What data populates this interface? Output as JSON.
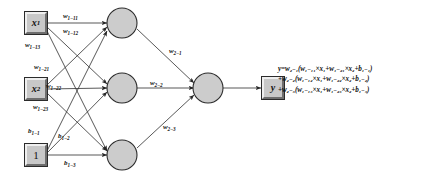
{
  "diagram": {
    "colors": {
      "node_fill": "#cccccc",
      "node_stroke": "#2b2b2b",
      "box_fill": "#c8c8c8",
      "edge": "#3a3a3a",
      "background": "#ffffff",
      "text": "#101010"
    },
    "inputs": [
      {
        "id": "x1",
        "base": "x",
        "sub": "1",
        "styled": "italic"
      },
      {
        "id": "x2",
        "base": "x",
        "sub": "2",
        "styled": "italic"
      },
      {
        "id": "bias",
        "base": "1",
        "sub": "",
        "styled": "plain"
      }
    ],
    "hidden_nodes": [
      {
        "id": "h1",
        "label": ""
      },
      {
        "id": "h2",
        "label": ""
      },
      {
        "id": "h3",
        "label": ""
      }
    ],
    "output_node": {
      "id": "o1",
      "label": ""
    },
    "output_box": {
      "id": "y",
      "base": "y",
      "sub": "",
      "styled": "italic"
    },
    "edge_labels": {
      "w1_11": {
        "base": "w",
        "sub": "1−11"
      },
      "w1_12": {
        "base": "w",
        "sub": "1−12"
      },
      "w1_13": {
        "base": "w",
        "sub": "1−13"
      },
      "w1_21": {
        "base": "w",
        "sub": "1−21"
      },
      "w1_22": {
        "base": "w",
        "sub": "1−22"
      },
      "w1_23": {
        "base": "w",
        "sub": "1−23"
      },
      "b1_1": {
        "base": "b",
        "sub": "1−1"
      },
      "b1_2": {
        "base": "b",
        "sub": "1−2"
      },
      "b1_3": {
        "base": "b",
        "sub": "1−3"
      },
      "w2_1": {
        "base": "w",
        "sub": "2−1"
      },
      "w2_2": {
        "base": "w",
        "sub": "2−2"
      },
      "w2_3": {
        "base": "w",
        "sub": "2−3"
      }
    },
    "equation": {
      "line1": "y=w₂₋₁(w₁₋₁₁×x₁+w₁₋₂₁×x₂+b₁₋₁)",
      "line2": "+w₂₋₂(w₁₋₁₂×x₁+w₁₋₂₂×x₂+b₁₋₂)",
      "line3": "+w₂₋₃(w₁₋₁₃×x₁+w₁₋₂₃×x₂+b₁₋₃)"
    }
  }
}
